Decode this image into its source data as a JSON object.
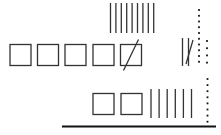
{
  "diagram": {
    "type": "base-ten-blocks-subtraction",
    "stroke_color": "#333333",
    "rows": [
      {
        "name": "regrouped-tens-row",
        "hundreds": 0,
        "tens": 9,
        "ones": 0
      },
      {
        "name": "minuend-row",
        "hundreds": 5,
        "hundreds_crossed": 1,
        "tens": 2,
        "tens_crossed": 1,
        "ones_columns": [
          10,
          4
        ]
      },
      {
        "name": "result-row",
        "hundreds": 2,
        "tens": 6,
        "ones": 8
      }
    ]
  }
}
